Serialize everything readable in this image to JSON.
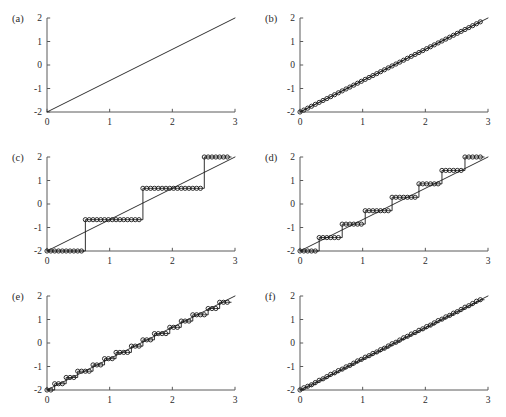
{
  "figure": {
    "background_color": "#ffffff",
    "axis_color": "#5a5a5a",
    "curve_color": "#1a1a1a",
    "marker_color": "#1a1a1a",
    "rows": 3,
    "columns": 2
  },
  "axes": {
    "x_ticks": [
      "0",
      "1",
      "2",
      "3"
    ],
    "x_tick_values": [
      0,
      1,
      2,
      3
    ],
    "y_ticks": [
      "-2",
      "-1",
      "0",
      "1",
      "2"
    ],
    "y_tick_values": [
      -2,
      -1,
      0,
      1,
      2
    ],
    "xlim": [
      0,
      3
    ],
    "ylim": [
      -2,
      2
    ],
    "grid": false
  },
  "panels": [
    {
      "id": "a",
      "label": "(a)"
    },
    {
      "id": "b",
      "label": "(b)"
    },
    {
      "id": "c",
      "label": "(c)"
    },
    {
      "id": "d",
      "label": "(d)"
    },
    {
      "id": "e",
      "label": "(e)"
    },
    {
      "id": "f",
      "label": "(f)"
    }
  ],
  "chart_data": [
    {
      "type": "line",
      "panel": "a",
      "title": "(a)",
      "xlabel": "",
      "ylabel": "",
      "xlim": [
        0,
        3
      ],
      "ylim": [
        -2,
        2
      ],
      "grid": false,
      "markers": false,
      "quantization_levels": null,
      "series": [
        {
          "name": "original ramp",
          "x": [
            0,
            3
          ],
          "values": [
            -2,
            2
          ]
        }
      ]
    },
    {
      "type": "line",
      "panel": "b",
      "title": "(b)",
      "xlabel": "",
      "ylabel": "",
      "xlim": [
        0,
        3
      ],
      "ylim": [
        -2,
        2
      ],
      "grid": false,
      "markers": true,
      "quantization_levels": null,
      "series": [
        {
          "name": "reference ramp",
          "x": [
            0,
            3
          ],
          "values": [
            -2,
            2
          ]
        },
        {
          "name": "sampled signal",
          "x": [
            0,
            0.0612,
            0.1224,
            0.1837,
            0.2449,
            0.3061,
            0.3673,
            0.4286,
            0.4898,
            0.551,
            0.6122,
            0.6735,
            0.7347,
            0.7959,
            0.8571,
            0.9184,
            0.9796,
            1.0408,
            1.102,
            1.1633,
            1.2245,
            1.2857,
            1.3469,
            1.4082,
            1.4694,
            1.5306,
            1.5918,
            1.6531,
            1.7143,
            1.7755,
            1.8367,
            1.898,
            1.9592,
            2.0204,
            2.0816,
            2.1429,
            2.2041,
            2.2653,
            2.3265,
            2.3878,
            2.449,
            2.5102,
            2.5714,
            2.6327,
            2.6939,
            2.7551,
            2.8163,
            2.8776
          ],
          "values": [
            -2,
            -1.9184,
            -1.8367,
            -1.7551,
            -1.6735,
            -1.5918,
            -1.5102,
            -1.4286,
            -1.3469,
            -1.2653,
            -1.1837,
            -1.102,
            -1.0204,
            -0.9388,
            -0.8571,
            -0.7755,
            -0.6939,
            -0.6122,
            -0.5306,
            -0.449,
            -0.3673,
            -0.2857,
            -0.2041,
            -0.1224,
            -0.0408,
            0.0408,
            0.1224,
            0.2041,
            0.2857,
            0.3673,
            0.449,
            0.5306,
            0.6122,
            0.6939,
            0.7755,
            0.8571,
            0.9388,
            1.0204,
            1.102,
            1.1837,
            1.2653,
            1.3469,
            1.4286,
            1.5102,
            1.5918,
            1.6735,
            1.7551,
            1.8367
          ]
        }
      ]
    },
    {
      "type": "line",
      "panel": "c",
      "title": "(c)",
      "xlabel": "",
      "ylabel": "",
      "xlim": [
        0,
        3
      ],
      "ylim": [
        -2,
        2
      ],
      "grid": false,
      "markers": true,
      "quantization_levels": 4,
      "quantization_bits": 2,
      "level_values": [
        -2,
        -0.667,
        0.667,
        2
      ],
      "series": [
        {
          "name": "reference ramp",
          "x": [
            0,
            3
          ],
          "values": [
            -2,
            2
          ]
        },
        {
          "name": "quantized signal",
          "x": [
            0,
            0.0612,
            0.1224,
            0.1837,
            0.2449,
            0.3061,
            0.3673,
            0.4286,
            0.4898,
            0.551,
            0.6122,
            0.6735,
            0.7347,
            0.7959,
            0.8571,
            0.9184,
            0.9796,
            1.0408,
            1.102,
            1.1633,
            1.2245,
            1.2857,
            1.3469,
            1.4082,
            1.4694,
            1.5306,
            1.5918,
            1.6531,
            1.7143,
            1.7755,
            1.8367,
            1.898,
            1.9592,
            2.0204,
            2.0816,
            2.1429,
            2.2041,
            2.2653,
            2.3265,
            2.3878,
            2.449,
            2.5102,
            2.5714,
            2.6327,
            2.6939,
            2.7551,
            2.8163,
            2.8776
          ],
          "values": [
            -2,
            -2,
            -2,
            -2,
            -2,
            -2,
            -2,
            -2,
            -2,
            -2,
            -0.667,
            -0.667,
            -0.667,
            -0.667,
            -0.667,
            -0.667,
            -0.667,
            -0.667,
            -0.667,
            -0.667,
            -0.667,
            -0.667,
            -0.667,
            -0.667,
            -0.667,
            0.667,
            0.667,
            0.667,
            0.667,
            0.667,
            0.667,
            0.667,
            0.667,
            0.667,
            0.667,
            0.667,
            0.667,
            0.667,
            0.667,
            0.667,
            0.667,
            2,
            2,
            2,
            2,
            2,
            2,
            2
          ]
        }
      ]
    },
    {
      "type": "line",
      "panel": "d",
      "title": "(d)",
      "xlabel": "",
      "ylabel": "",
      "xlim": [
        0,
        3
      ],
      "ylim": [
        -2,
        2
      ],
      "grid": false,
      "markers": true,
      "quantization_levels": 8,
      "quantization_bits": 3,
      "level_values": [
        -2,
        -1.4286,
        -0.857,
        -0.286,
        0.286,
        0.857,
        1.4286,
        2
      ],
      "series": [
        {
          "name": "reference ramp",
          "x": [
            0,
            3
          ],
          "values": [
            -2,
            2
          ]
        },
        {
          "name": "quantized signal",
          "x": [
            0,
            0.0612,
            0.1224,
            0.1837,
            0.2449,
            0.3061,
            0.3673,
            0.4286,
            0.4898,
            0.551,
            0.6122,
            0.6735,
            0.7347,
            0.7959,
            0.8571,
            0.9184,
            0.9796,
            1.0408,
            1.102,
            1.1633,
            1.2245,
            1.2857,
            1.3469,
            1.4082,
            1.4694,
            1.5306,
            1.5918,
            1.6531,
            1.7143,
            1.7755,
            1.8367,
            1.898,
            1.9592,
            2.0204,
            2.0816,
            2.1429,
            2.2041,
            2.2653,
            2.3265,
            2.3878,
            2.449,
            2.5102,
            2.5714,
            2.6327,
            2.6939,
            2.7551,
            2.8163,
            2.8776
          ],
          "values": [
            -2,
            -2,
            -2,
            -2,
            -2,
            -1.4286,
            -1.4286,
            -1.4286,
            -1.4286,
            -1.4286,
            -1.4286,
            -0.857,
            -0.857,
            -0.857,
            -0.857,
            -0.857,
            -0.857,
            -0.286,
            -0.286,
            -0.286,
            -0.286,
            -0.286,
            -0.286,
            -0.286,
            0.286,
            0.286,
            0.286,
            0.286,
            0.286,
            0.286,
            0.286,
            0.857,
            0.857,
            0.857,
            0.857,
            0.857,
            0.857,
            1.4286,
            1.4286,
            1.4286,
            1.4286,
            1.4286,
            1.4286,
            2,
            2,
            2,
            2,
            2
          ]
        }
      ]
    },
    {
      "type": "line",
      "panel": "e",
      "title": "(e)",
      "xlabel": "",
      "ylabel": "",
      "xlim": [
        0,
        3
      ],
      "ylim": [
        -2,
        2
      ],
      "grid": false,
      "markers": true,
      "quantization_levels": 16,
      "quantization_bits": 4,
      "series": [
        {
          "name": "reference ramp",
          "x": [
            0,
            3
          ],
          "values": [
            -2,
            2
          ]
        },
        {
          "name": "quantized signal",
          "x": [
            0,
            0.0612,
            0.1224,
            0.1837,
            0.2449,
            0.3061,
            0.3673,
            0.4286,
            0.4898,
            0.551,
            0.6122,
            0.6735,
            0.7347,
            0.7959,
            0.8571,
            0.9184,
            0.9796,
            1.0408,
            1.102,
            1.1633,
            1.2245,
            1.2857,
            1.3469,
            1.4082,
            1.4694,
            1.5306,
            1.5918,
            1.6531,
            1.7143,
            1.7755,
            1.8367,
            1.898,
            1.9592,
            2.0204,
            2.0816,
            2.1429,
            2.2041,
            2.2653,
            2.3265,
            2.3878,
            2.449,
            2.5102,
            2.5714,
            2.6327,
            2.6939,
            2.7551,
            2.8163,
            2.8776
          ],
          "values": [
            -2,
            -2,
            -1.7333,
            -1.7333,
            -1.7333,
            -1.4667,
            -1.4667,
            -1.4667,
            -1.2,
            -1.2,
            -1.2,
            -1.2,
            -0.9333,
            -0.9333,
            -0.9333,
            -0.6667,
            -0.6667,
            -0.6667,
            -0.4,
            -0.4,
            -0.4,
            -0.4,
            -0.1333,
            -0.1333,
            -0.1333,
            0.1333,
            0.1333,
            0.1333,
            0.4,
            0.4,
            0.4,
            0.4,
            0.6667,
            0.6667,
            0.6667,
            0.9333,
            0.9333,
            0.9333,
            1.2,
            1.2,
            1.2,
            1.2,
            1.4667,
            1.4667,
            1.4667,
            1.7333,
            1.7333,
            1.7333
          ]
        }
      ]
    },
    {
      "type": "line",
      "panel": "f",
      "title": "(f)",
      "xlabel": "",
      "ylabel": "",
      "xlim": [
        0,
        3
      ],
      "ylim": [
        -2,
        2
      ],
      "grid": false,
      "markers": true,
      "quantization_levels": 64,
      "quantization_bits": 6,
      "series": [
        {
          "name": "reference ramp",
          "x": [
            0,
            3
          ],
          "values": [
            -2,
            2
          ]
        },
        {
          "name": "quantized signal",
          "x": [
            0,
            0.0612,
            0.1224,
            0.1837,
            0.2449,
            0.3061,
            0.3673,
            0.4286,
            0.4898,
            0.551,
            0.6122,
            0.6735,
            0.7347,
            0.7959,
            0.8571,
            0.9184,
            0.9796,
            1.0408,
            1.102,
            1.1633,
            1.2245,
            1.2857,
            1.3469,
            1.4082,
            1.4694,
            1.5306,
            1.5918,
            1.6531,
            1.7143,
            1.7755,
            1.8367,
            1.898,
            1.9592,
            2.0204,
            2.0816,
            2.1429,
            2.2041,
            2.2653,
            2.3265,
            2.3878,
            2.449,
            2.5102,
            2.5714,
            2.6327,
            2.6939,
            2.7551,
            2.8163,
            2.8776
          ],
          "values": [
            -2,
            -1.9048,
            -1.8413,
            -1.7778,
            -1.6825,
            -1.5873,
            -1.5238,
            -1.4286,
            -1.3333,
            -1.2698,
            -1.1746,
            -1.1111,
            -1.0159,
            -0.9524,
            -0.8571,
            -0.7619,
            -0.6984,
            -0.6032,
            -0.5397,
            -0.4444,
            -0.381,
            -0.2857,
            -0.2222,
            -0.127,
            -0.0317,
            0.0317,
            0.127,
            0.2222,
            0.2857,
            0.381,
            0.4444,
            0.5397,
            0.6032,
            0.6984,
            0.7619,
            0.8571,
            0.9524,
            1.0159,
            1.1111,
            1.1746,
            1.2698,
            1.3333,
            1.4286,
            1.5238,
            1.5873,
            1.6825,
            1.7778,
            1.8413
          ]
        }
      ]
    }
  ]
}
